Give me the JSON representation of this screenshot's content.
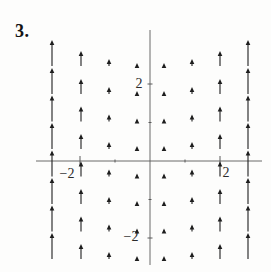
{
  "figure": {
    "exercise_number": "3.",
    "background": "#fdfdfc"
  },
  "chart_data": {
    "type": "quiver",
    "title": "",
    "arrow_direction": "up",
    "x_range": [
      -2.9,
      2.9
    ],
    "y_range": [
      -2.6,
      2.5
    ],
    "x_ticks": [
      {
        "value": -2,
        "label": "−2",
        "major": true
      },
      {
        "value": -1,
        "label": "",
        "major": false
      },
      {
        "value": 1,
        "label": "",
        "major": false
      },
      {
        "value": 2,
        "label": "2",
        "major": true
      }
    ],
    "y_ticks": [
      {
        "value": 2,
        "label": "2",
        "major": true
      },
      {
        "value": 1,
        "label": "",
        "major": false
      },
      {
        "value": -1,
        "label": "",
        "major": false
      },
      {
        "value": -2,
        "label": "−2",
        "major": true
      }
    ],
    "columns_x_units": [
      -2.8,
      -2.0,
      -1.2,
      -0.4,
      0.4,
      1.2,
      2.0,
      2.8
    ],
    "rows_y_units": [
      2.45,
      1.74,
      1.03,
      0.31,
      -0.4,
      -1.12,
      -1.83,
      -2.55
    ],
    "arrow_length_units_by_column": [
      0.68,
      0.39,
      0.18,
      0.08,
      0.08,
      0.18,
      0.39,
      0.68
    ],
    "layout_px": {
      "width": 271,
      "height": 272,
      "origin": {
        "x": 150,
        "y": 161
      },
      "px_per_unit_x": 35,
      "px_per_unit_y": 38.5,
      "x_axis": {
        "x1": 36,
        "x2": 262
      },
      "y_axis": {
        "y1": 30,
        "y2": 265
      },
      "columns_x": [
        52,
        81,
        109,
        137,
        164,
        192,
        220,
        248
      ],
      "rows_tail_y": [
        66,
        94,
        121.5,
        149,
        176.5,
        204,
        231.5,
        259
      ],
      "arrow_length_px": [
        26,
        15,
        7,
        3,
        3,
        7,
        15,
        26
      ],
      "head_w": 2.3,
      "head_h": 5,
      "tick_len_major_x": 10,
      "tick_len_major_y": 5,
      "tick_len_minor": 3
    },
    "tick_labels_px": [
      {
        "text": "−2",
        "x": 67,
        "y": 178,
        "axis": "x"
      },
      {
        "text": "2",
        "x": 226,
        "y": 177,
        "axis": "x"
      },
      {
        "text": "2",
        "x": 139,
        "y": 88,
        "axis": "y"
      },
      {
        "text": "−2",
        "x": 131,
        "y": 241,
        "axis": "y"
      }
    ],
    "colors": {
      "arrow": "#1e1e1e",
      "axis": "#5a5a5a",
      "label": "#2b2b2b"
    },
    "label_font_px": 14
  }
}
